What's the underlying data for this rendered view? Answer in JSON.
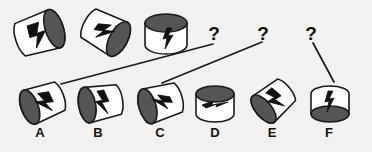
{
  "puzzle": {
    "background_color": "#f2f1ef",
    "ink_color": "#1a1a1a",
    "shade_color": "#555555",
    "face_color": "#ffffff",
    "sequence_label": "top-sequence-row",
    "options_label": "answer-options-row",
    "sequence": [
      {
        "id": "seq-1",
        "shape": "tilted-cylinder",
        "icon": "lightning-bolt-icon",
        "dark_face": "right",
        "cx": 41,
        "cy": 33
      },
      {
        "id": "seq-2",
        "shape": "tilted-cylinder",
        "icon": "lightning-bolt-icon",
        "dark_face": "upper-right",
        "cx": 107,
        "cy": 33
      },
      {
        "id": "seq-3",
        "shape": "upright-cylinder",
        "icon": "lightning-bolt-icon",
        "dark_face": "top",
        "cx": 166,
        "cy": 34
      }
    ],
    "unknowns": [
      {
        "id": "unknown-1",
        "text": "?",
        "x": 214,
        "y": 24
      },
      {
        "id": "unknown-2",
        "text": "?",
        "x": 263,
        "y": 24
      },
      {
        "id": "unknown-3",
        "text": "?",
        "x": 311,
        "y": 24
      }
    ],
    "connectors": [
      {
        "id": "connector-a",
        "x1": 61,
        "y1": 84,
        "x2": 213,
        "y2": 44
      },
      {
        "id": "connector-b",
        "x1": 162,
        "y1": 83,
        "x2": 262,
        "y2": 42
      },
      {
        "id": "connector-c",
        "x1": 313,
        "y1": 43,
        "x2": 334,
        "y2": 82
      }
    ],
    "options": [
      {
        "id": "option-a",
        "label": "A",
        "shape": "tilted-cylinder",
        "icon": "lightning-bolt-icon",
        "dark_face": "upper-left",
        "cx": 41,
        "cy": 103,
        "label_x": 40,
        "label_y": 131
      },
      {
        "id": "option-b",
        "label": "B",
        "shape": "tilted-cylinder",
        "icon": "lightning-bolt-icon",
        "dark_face": "left",
        "cx": 99,
        "cy": 103,
        "label_x": 98,
        "label_y": 131
      },
      {
        "id": "option-c",
        "label": "C",
        "shape": "tilted-cylinder",
        "icon": "lightning-bolt-icon",
        "dark_face": "left",
        "cx": 159,
        "cy": 103,
        "label_x": 160,
        "label_y": 131
      },
      {
        "id": "option-d",
        "label": "D",
        "shape": "upright-cylinder",
        "icon": "lightning-bolt-icon",
        "dark_face": "top",
        "cx": 215,
        "cy": 104,
        "label_x": 215,
        "label_y": 131
      },
      {
        "id": "option-e",
        "label": "E",
        "shape": "tilted-cylinder",
        "icon": "lightning-bolt-icon",
        "dark_face": "upper-left",
        "cx": 272,
        "cy": 102,
        "label_x": 272,
        "label_y": 131
      },
      {
        "id": "option-f",
        "label": "F",
        "shape": "upright-cylinder",
        "icon": "lightning-bolt-icon",
        "dark_face": "bottom",
        "cx": 330,
        "cy": 104,
        "label_x": 329,
        "label_y": 131
      }
    ]
  }
}
